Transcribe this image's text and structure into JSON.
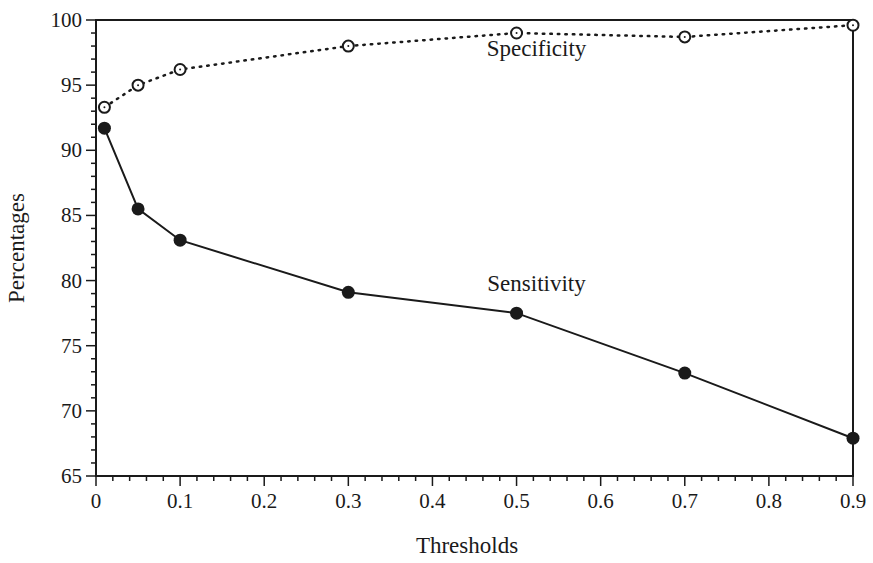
{
  "chart_data": {
    "type": "line",
    "title": "",
    "xlabel": "Thresholds",
    "ylabel": "Percentages",
    "xlim": [
      0,
      0.9
    ],
    "ylim": [
      65,
      100
    ],
    "grid": false,
    "legend": "none (inline series labels)",
    "x_ticks": [
      "0",
      "0.1",
      "0.2",
      "0.3",
      "0.4",
      "0.5",
      "0.6",
      "0.7",
      "0.8",
      "0.9"
    ],
    "y_ticks": [
      "65",
      "70",
      "75",
      "80",
      "85",
      "90",
      "95",
      "100"
    ],
    "x": [
      0.01,
      0.05,
      0.1,
      0.3,
      0.5,
      0.7,
      0.9
    ],
    "series": [
      {
        "name": "Specificity",
        "style": "dotted line, open circle markers",
        "values": [
          93.3,
          95.0,
          96.2,
          98.0,
          99.0,
          98.7,
          99.6
        ],
        "label_position": {
          "x": 0.45,
          "y": 97.2
        }
      },
      {
        "name": "Sensitivity",
        "style": "solid line, filled circle markers",
        "values": [
          91.7,
          85.5,
          83.1,
          79.1,
          77.5,
          72.9,
          67.9
        ],
        "label_position": {
          "x": 0.45,
          "y": 79.2
        }
      }
    ]
  },
  "colors": {
    "ink": "#1a1a1a",
    "background": "#ffffff"
  }
}
